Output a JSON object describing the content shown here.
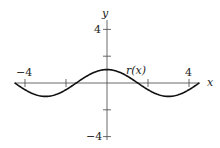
{
  "chart_data": {
    "type": "line",
    "title": "",
    "xlabel": "x",
    "ylabel": "y",
    "xlim": [
      -4.5,
      4.5
    ],
    "ylim": [
      -4,
      4
    ],
    "grid": false,
    "x_ticks": [
      -4,
      -2,
      2,
      4
    ],
    "x_tick_labels": [
      "-4",
      "4"
    ],
    "y_ticks": [
      -4,
      -2,
      2,
      4
    ],
    "y_tick_labels": [
      "-4",
      "4"
    ],
    "series": [
      {
        "name": "r(x)",
        "formula": "cos(pi*x/3)",
        "x": [
          -4.5,
          -3,
          -1.5,
          0,
          1.5,
          3,
          4.5
        ],
        "values": [
          0,
          -1,
          0,
          1,
          0,
          -1,
          0
        ]
      }
    ],
    "annotations": [
      {
        "text": "r(x)",
        "x": 1.7,
        "y": 1.3
      }
    ]
  },
  "labels": {
    "x_axis": "x",
    "y_axis": "y",
    "x_neg": "−4",
    "x_pos": "4",
    "y_pos": "4",
    "y_neg": "−4",
    "curve": "r(x)"
  }
}
